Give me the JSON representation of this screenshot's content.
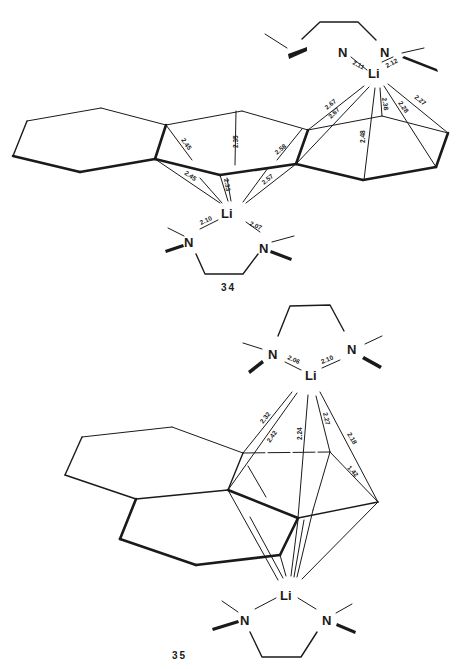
{
  "figure": {
    "compounds": [
      {
        "id": "34",
        "label": "34",
        "top_ligand": {
          "metal": "Li",
          "donors": [
            "N",
            "N"
          ],
          "n_li_distances": [
            "2.11",
            "2.12"
          ]
        },
        "bottom_ligand": {
          "metal": "Li",
          "donors": [
            "N",
            "N"
          ],
          "n_li_distances": [
            "2.10",
            "2.07"
          ]
        },
        "top_li_contacts": [
          "2.67",
          "2.67",
          "2.48",
          "2.38",
          "2.28",
          "2.27"
        ],
        "bottom_li_contacts": [
          "2.45",
          "2.45",
          "2.35",
          "2.33",
          "2.58",
          "2.57"
        ]
      },
      {
        "id": "35",
        "label": "35",
        "top_ligand": {
          "metal": "Li",
          "donors": [
            "N",
            "N"
          ],
          "n_li_distances": [
            "2.06",
            "2.10"
          ]
        },
        "bottom_ligand": {
          "metal": "Li",
          "donors": [
            "N",
            "N"
          ],
          "n_li_distances": []
        },
        "top_li_contacts": [
          "2.32",
          "2.42",
          "2.24",
          "2.27",
          "2.18"
        ],
        "ring_bond": "1.42"
      }
    ]
  }
}
